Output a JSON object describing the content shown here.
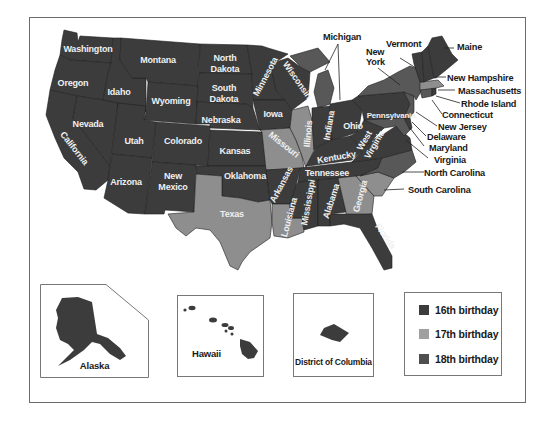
{
  "map": {
    "title": "",
    "colors": {
      "16th": "#3c3c3c",
      "17th": "#8e8e8e",
      "18th": "#585858",
      "border": "#1e1e1e"
    },
    "states": {
      "washington": "Washington",
      "oregon": "Oregon",
      "california": "California",
      "idaho": "Idaho",
      "nevada": "Nevada",
      "montana": "Montana",
      "wyoming": "Wyoming",
      "utah": "Utah",
      "colorado": "Colorado",
      "arizona": "Arizona",
      "new_mexico_1": "New",
      "new_mexico_2": "Mexico",
      "north_dakota_1": "North",
      "north_dakota_2": "Dakota",
      "south_dakota_1": "South",
      "south_dakota_2": "Dakota",
      "nebraska": "Nebraska",
      "kansas": "Kansas",
      "oklahoma": "Oklahoma",
      "texas": "Texas",
      "minnesota": "Minnesota",
      "iowa": "Iowa",
      "missouri": "Missouri",
      "arkansas": "Arkansas",
      "louisiana": "Louisiana",
      "wisconsin": "Wisconsin",
      "illinois": "Illinois",
      "mississippi": "Mississippi",
      "indiana": "Indiana",
      "kentucky": "Kentucky",
      "tennessee": "Tennessee",
      "alabama": "Alabama",
      "ohio": "Ohio",
      "west_virginia_1": "West",
      "west_virginia_2": "Virginia",
      "georgia": "Georgia",
      "florida": "Florida",
      "pennsylvania": "Pennsylvania"
    },
    "callouts": {
      "michigan": "Michigan",
      "new_york_1": "New",
      "new_york_2": "York",
      "vermont": "Vermont",
      "maine": "Maine",
      "new_hampshire": "New Hampshire",
      "massachusetts": "Massachusetts",
      "rhode_island": "Rhode Island",
      "connecticut": "Connecticut",
      "new_jersey": "New Jersey",
      "delaware": "Delaware",
      "maryland": "Maryland",
      "virginia": "Virginia",
      "north_carolina": "North Carolina",
      "south_carolina": "South Carolina"
    }
  },
  "insets": {
    "alaska": "Alaska",
    "hawaii": "Hawaii",
    "dc": "District of Columbia"
  },
  "legend": {
    "items": [
      {
        "label": "16th birthday",
        "color": "#3c3c3c"
      },
      {
        "label": "17th birthday",
        "color": "#a0a0a0"
      },
      {
        "label": "18th birthday",
        "color": "#4e4e4e"
      }
    ]
  }
}
